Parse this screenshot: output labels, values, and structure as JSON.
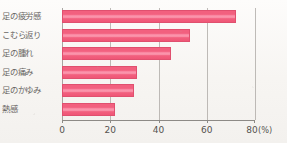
{
  "chart_data": {
    "type": "bar",
    "orientation": "horizontal",
    "title": "",
    "xlabel": "(%)",
    "ylabel": "",
    "xlim": [
      0,
      80
    ],
    "xticks": [
      "0",
      "20",
      "40",
      "60",
      "80"
    ],
    "xtick_values": [
      0,
      20,
      40,
      60,
      80
    ],
    "grid": true,
    "legend": null,
    "categories": [
      "足の疲労感",
      "こむら返り",
      "足の腫れ",
      "足の痛み",
      "足のかゆみ",
      "熱感"
    ],
    "values": [
      72,
      53,
      45,
      31,
      30,
      22
    ],
    "unit": "%",
    "bar_color": "#f2607f",
    "bar_border_color": "#e0506f",
    "grid_color": "#a9a6a2",
    "axis_color": "#8d8a86",
    "background_color": "#f7f5f2",
    "text_color": "#56534f"
  }
}
